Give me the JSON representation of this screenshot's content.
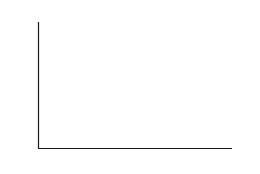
{
  "figure": {
    "background_color": "#ffffff",
    "ink_color": "#1a1a1a",
    "mesh_color": "#2b2b2b",
    "fill_color": "#ffffff"
  },
  "axes": {
    "x_axis_label": "x",
    "y_axis_label": "y",
    "x_ticks": [
      {
        "value": 0.5,
        "label": "0.5"
      },
      {
        "value": 1.0,
        "label": "1"
      },
      {
        "value": 1.5,
        "label": "1.5"
      },
      {
        "value": 2.0,
        "label": "2"
      }
    ],
    "y_ticks": [
      {
        "value": 0.0,
        "label": "0"
      },
      {
        "value": 0.2,
        "label": "0.2"
      },
      {
        "value": 0.4,
        "label": "0.4"
      },
      {
        "value": 0.6,
        "label": "0.6"
      },
      {
        "value": 0.8,
        "label": "0.8"
      },
      {
        "value": 1.0,
        "label": "1"
      },
      {
        "value": 1.2,
        "label": "1.2"
      },
      {
        "value": 1.4,
        "label": "1.4"
      }
    ]
  },
  "chart_data": {
    "type": "area",
    "title": "",
    "subtitle": "",
    "xlabel": "x",
    "ylabel": "y",
    "xlim": [
      0,
      2
    ],
    "ylim": [
      0,
      1.55
    ],
    "grid": true,
    "grid_style": "dense vertical and horizontal mesh lines filling the area under the curve",
    "legend": null,
    "annotations": [],
    "xticklabels": [
      "0.5",
      "1",
      "1.5",
      "2"
    ],
    "yticklabels": [
      "0",
      "0.2",
      "0.4",
      "0.6",
      "0.8",
      "1",
      "1.2",
      "1.4"
    ],
    "series": [
      {
        "name": "curve",
        "x": [
          0.0,
          0.05,
          0.1,
          0.15,
          0.2,
          0.25,
          0.3,
          0.35,
          0.4,
          0.45,
          0.5,
          0.55,
          0.6,
          0.65,
          0.7,
          0.75,
          0.8,
          0.85,
          0.9,
          0.95,
          1.0,
          1.05,
          1.1,
          1.15,
          1.2,
          1.25,
          1.3,
          1.35,
          1.4,
          1.45,
          1.5,
          1.55,
          1.6,
          1.65,
          1.7,
          1.75,
          1.8,
          1.85,
          1.9,
          1.95,
          2.0
        ],
        "values": [
          1.52,
          1.52,
          1.51,
          1.5,
          1.48,
          1.45,
          1.42,
          1.38,
          1.33,
          1.28,
          1.23,
          1.17,
          1.12,
          1.06,
          1.0,
          0.95,
          0.9,
          0.85,
          0.8,
          0.76,
          0.72,
          0.68,
          0.65,
          0.62,
          0.59,
          0.57,
          0.55,
          0.53,
          0.52,
          0.52,
          0.52,
          0.53,
          0.54,
          0.55,
          0.57,
          0.58,
          0.6,
          0.61,
          0.63,
          0.64,
          0.65
        ]
      }
    ]
  }
}
